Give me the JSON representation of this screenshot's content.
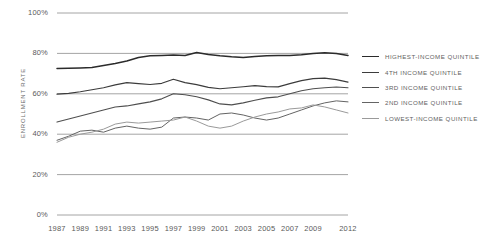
{
  "chart_data": {
    "type": "line",
    "title": "",
    "subtitle": "",
    "xlabel": "",
    "ylabel": "ENROLLMENT RATE",
    "xlim": [
      1987,
      2012
    ],
    "ylim": [
      0,
      100
    ],
    "yunit": "%",
    "grid": true,
    "gridlines_y": [
      0,
      20,
      40,
      60,
      80,
      100
    ],
    "legend_position": "right",
    "ytick_labels": [
      "0%",
      "20%",
      "40%",
      "60%",
      "80%",
      "100%"
    ],
    "ytick_values": [
      0,
      20,
      40,
      60,
      80,
      100
    ],
    "xtick_labels": [
      "1987",
      "1989",
      "1991",
      "1993",
      "1995",
      "1997",
      "1999",
      "2001",
      "2003",
      "2005",
      "2007",
      "2009",
      "2012"
    ],
    "xtick_values": [
      1987,
      1989,
      1991,
      1993,
      1995,
      1997,
      1999,
      2001,
      2003,
      2005,
      2007,
      2009,
      2012
    ],
    "x": [
      1987,
      1988,
      1989,
      1990,
      1991,
      1992,
      1993,
      1994,
      1995,
      1996,
      1997,
      1998,
      1999,
      2000,
      2001,
      2002,
      2003,
      2004,
      2005,
      2006,
      2007,
      2008,
      2009,
      2010,
      2011,
      2012
    ],
    "series": [
      {
        "name": "HIGHEST-INCOME QUINTILE",
        "color": "#2b2b2b",
        "width": 1.5,
        "values": [
          72.5,
          72.6,
          72.8,
          73.0,
          74.0,
          75.0,
          76.2,
          78.0,
          78.8,
          79.0,
          79.2,
          79.0,
          80.4,
          79.5,
          78.8,
          78.3,
          78.0,
          78.5,
          78.8,
          79.0,
          79.0,
          79.3,
          80.0,
          80.3,
          80.0,
          79.0
        ]
      },
      {
        "name": "4TH INCOME QUINTILE",
        "color": "#3c3c3c",
        "width": 1.2,
        "values": [
          59.8,
          60.2,
          61.0,
          62.0,
          63.0,
          64.4,
          65.5,
          65.0,
          64.6,
          65.2,
          67.2,
          65.5,
          64.5,
          63.2,
          62.5,
          63.0,
          63.5,
          64.0,
          63.6,
          63.4,
          65.0,
          66.5,
          67.5,
          67.8,
          67.0,
          65.8
        ]
      },
      {
        "name": "3RD INCOME QUINTILE",
        "color": "#4f4f4f",
        "width": 1.1,
        "values": [
          46.0,
          47.5,
          49.0,
          50.5,
          52.0,
          53.5,
          54.0,
          55.0,
          56.0,
          57.5,
          60.0,
          59.5,
          58.5,
          57.0,
          55.0,
          54.5,
          55.5,
          56.8,
          58.0,
          58.5,
          60.0,
          61.5,
          62.5,
          63.0,
          63.4,
          63.0
        ]
      },
      {
        "name": "2ND INCOME QUINTILE",
        "color": "#646464",
        "width": 1.0,
        "values": [
          37.0,
          39.0,
          41.5,
          42.0,
          41.0,
          43.0,
          44.0,
          43.0,
          42.5,
          43.5,
          48.0,
          48.5,
          48.0,
          47.0,
          50.0,
          50.5,
          49.5,
          48.0,
          47.0,
          48.0,
          50.0,
          52.0,
          54.0,
          55.5,
          56.5,
          56.0
        ]
      },
      {
        "name": "LOWEST-INCOME QUINTILE",
        "color": "#9a9a9a",
        "width": 1.0,
        "values": [
          36.0,
          38.5,
          40.0,
          41.0,
          42.5,
          45.0,
          46.0,
          45.5,
          46.0,
          46.5,
          47.0,
          48.5,
          46.5,
          44.0,
          43.0,
          44.0,
          46.5,
          48.5,
          50.0,
          51.0,
          52.5,
          53.0,
          54.5,
          53.5,
          52.0,
          50.5
        ]
      }
    ]
  },
  "legend": {
    "items": [
      {
        "label": "HIGHEST-INCOME QUINTILE",
        "color": "#2b2b2b",
        "width": 1.6
      },
      {
        "label": "4TH INCOME QUINTILE",
        "color": "#3c3c3c",
        "width": 1.4
      },
      {
        "label": "3RD INCOME QUINTILE",
        "color": "#4f4f4f",
        "width": 1.2
      },
      {
        "label": "2ND INCOME QUINTILE",
        "color": "#646464",
        "width": 1.1
      },
      {
        "label": "LOWEST-INCOME QUINTILE",
        "color": "#9a9a9a",
        "width": 1.0
      }
    ]
  },
  "axis": {
    "y_title": "ENROLLMENT RATE"
  },
  "style": {
    "grid_color": "#9a9a9a",
    "text_color": "#5a5a5a",
    "background": "#ffffff"
  }
}
